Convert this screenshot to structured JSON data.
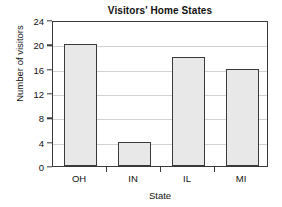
{
  "chart_data": {
    "type": "bar",
    "title": "Visitors' Home States",
    "xlabel": "State",
    "ylabel": "Number of visitors",
    "categories": [
      "OH",
      "IN",
      "IL",
      "MI"
    ],
    "values": [
      20,
      4,
      18,
      16
    ],
    "ylim": [
      0,
      24
    ],
    "yticks": [
      0,
      4,
      8,
      12,
      16,
      20,
      24
    ],
    "ytick_labels": [
      "0",
      "4",
      "8",
      "12",
      "16",
      "20",
      "24"
    ],
    "grid": "horizontal",
    "legend": "none",
    "colors": {
      "bar_fill": "#e8e8e8",
      "bar_edge": "#3a3a3a",
      "gridline": "#d2d2d2",
      "axis": "#3a3a3a",
      "text": "#111111",
      "background": "#ffffff"
    }
  }
}
